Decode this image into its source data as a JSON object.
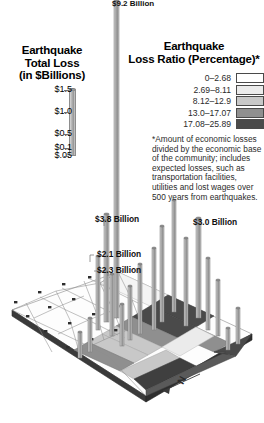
{
  "scale_legend": {
    "title_line1": "Earthquake",
    "title_line2": "Total Loss",
    "title_line3": "(in $Billions)",
    "ticks": [
      {
        "label": "$1.5",
        "pos": 0
      },
      {
        "label": "$1.0",
        "pos": 22
      },
      {
        "label": "$0.5",
        "pos": 44
      },
      {
        "label": "$0.1",
        "pos": 58
      },
      {
        "label": "$.05",
        "pos": 66
      }
    ]
  },
  "ratio_legend": {
    "title_line1": "Earthquake",
    "title_line2": "Loss Ratio (Percentage)*",
    "classes": [
      {
        "range": "0–2.68",
        "color": "#ffffff"
      },
      {
        "range": "2.69–8.11",
        "color": "#ebebeb"
      },
      {
        "range": "8.12–12.9",
        "color": "#c8c8c8"
      },
      {
        "range": "13.0–17.07",
        "color": "#8f8f8f"
      },
      {
        "range": "17.08–25.89",
        "color": "#4a4a4a"
      }
    ],
    "footnote": "*Amount of economic losses divided by the economic base of the community; includes expected losses, such as transportation facilities, utilities and lost wages over 500 years from earthquakes."
  },
  "callouts": [
    {
      "text": "$9.2 Billion",
      "x": 112,
      "y": -1
    },
    {
      "text": "$3.8 Billion",
      "x": 95,
      "y": 215
    },
    {
      "text": "$2.1 Billion",
      "x": 97,
      "y": 250
    },
    {
      "text": "$2.3 Billion",
      "x": 97,
      "y": 266
    },
    {
      "text": "$3.0 Billion",
      "x": 193,
      "y": 218
    }
  ],
  "compass": {
    "label": "N"
  },
  "chart_data": {
    "type": "bar",
    "subtitle": "Isometric 3-D choropleth map with proportional vertical loss bars",
    "xlabel": "",
    "ylabel": "Total Loss (Billions of dollars)",
    "value_unit": "$ Billions",
    "grid": false,
    "legend_position": "top-right",
    "height_scale_ticks": [
      1.5,
      1.0,
      0.5,
      0.1,
      0.05
    ],
    "choropleth_classes": [
      "0–2.68",
      "2.69–8.11",
      "8.12–12.9",
      "13.0–17.07",
      "17.08–25.89"
    ],
    "choropleth_colors": [
      "#ffffff",
      "#ebebeb",
      "#c8c8c8",
      "#8f8f8f",
      "#4a4a4a"
    ],
    "labeled_values": [
      {
        "label": "$9.2 Billion",
        "value": 9.2
      },
      {
        "label": "$3.8 Billion",
        "value": 3.8
      },
      {
        "label": "$3.0 Billion",
        "value": 3.0
      },
      {
        "label": "$2.3 Billion",
        "value": 2.3
      },
      {
        "label": "$2.1 Billion",
        "value": 2.1
      }
    ],
    "bars": [
      {
        "x": 114,
        "y": 318,
        "h": 318,
        "w": 5,
        "value": 9.2
      },
      {
        "x": 104,
        "y": 322,
        "h": 108,
        "w": 5,
        "value": 3.8
      },
      {
        "x": 96,
        "y": 330,
        "h": 74,
        "w": 4,
        "value": 2.1
      },
      {
        "x": 110,
        "y": 336,
        "h": 62,
        "w": 4,
        "value": 2.3
      },
      {
        "x": 196,
        "y": 318,
        "h": 100,
        "w": 5,
        "value": 3.0
      },
      {
        "x": 152,
        "y": 330,
        "h": 82,
        "w": 4,
        "value": 2.4
      },
      {
        "x": 160,
        "y": 322,
        "h": 96,
        "w": 4,
        "value": 2.8
      },
      {
        "x": 172,
        "y": 312,
        "h": 112,
        "w": 4,
        "value": 3.2
      },
      {
        "x": 184,
        "y": 326,
        "h": 88,
        "w": 4,
        "value": 2.5
      },
      {
        "x": 206,
        "y": 330,
        "h": 72,
        "w": 4,
        "value": 2.0
      },
      {
        "x": 216,
        "y": 336,
        "h": 56,
        "w": 4,
        "value": 1.6
      },
      {
        "x": 138,
        "y": 334,
        "h": 70,
        "w": 4,
        "value": 1.9
      },
      {
        "x": 128,
        "y": 340,
        "h": 54,
        "w": 4,
        "value": 1.5
      },
      {
        "x": 120,
        "y": 346,
        "h": 42,
        "w": 4,
        "value": 1.1
      },
      {
        "x": 88,
        "y": 352,
        "h": 34,
        "w": 4,
        "value": 0.9
      },
      {
        "x": 78,
        "y": 358,
        "h": 26,
        "w": 4,
        "value": 0.6
      },
      {
        "x": 236,
        "y": 344,
        "h": 36,
        "w": 4,
        "value": 0.8
      },
      {
        "x": 226,
        "y": 350,
        "h": 22,
        "w": 4,
        "value": 0.5
      }
    ]
  }
}
